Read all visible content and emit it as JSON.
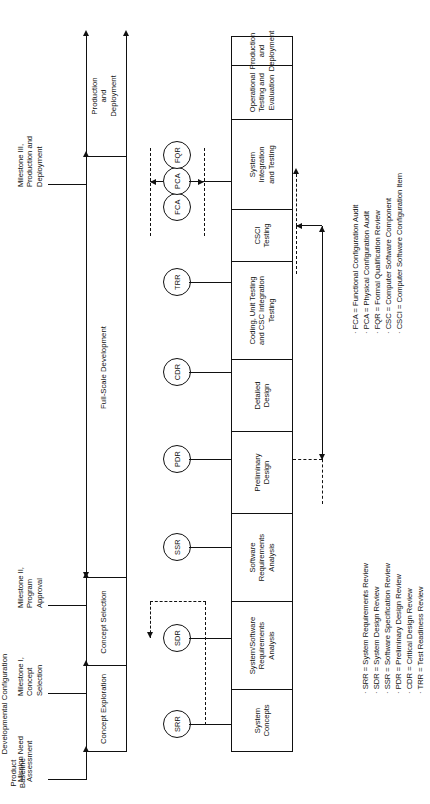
{
  "figure": {
    "orientation": "landscape-rotated-90",
    "phases": [
      {
        "id": "concept-exploration",
        "label": "Concept Exploration"
      },
      {
        "id": "concept-selection",
        "label": "Concept Selection"
      },
      {
        "id": "full-scale-development",
        "label": "Full-Scale Development"
      },
      {
        "id": "production-and-deployment",
        "label": "Production\nand\nDeployment"
      }
    ],
    "phase_band_labels": {
      "full_scale_development": "Full-Scale Development",
      "production_and_deployment_line1": "Production",
      "production_and_deployment_line2": "and",
      "production_and_deployment_line3": "Deployment"
    },
    "milestones": [
      {
        "id": "mission-need",
        "line1": "Mission Need",
        "line2": "Assessment",
        "line3": ""
      },
      {
        "id": "milestone-1",
        "line1": "Milestone I,",
        "line2": "Concept",
        "line3": "Selection"
      },
      {
        "id": "milestone-2",
        "line1": "Milestone II,",
        "line2": "Program",
        "line3": "Approval"
      },
      {
        "id": "milestone-3",
        "line1": "Milestone III,",
        "line2": "Production and",
        "line3": "Deployment"
      }
    ],
    "activities": [
      {
        "id": "system-concepts",
        "line1": "System",
        "line2": "Concepts",
        "line3": ""
      },
      {
        "id": "system-software-requirements-analysis",
        "line1": "System/Software",
        "line2": "Requirements",
        "line3": "Analysis"
      },
      {
        "id": "software-requirements-analysis",
        "line1": "Software",
        "line2": "Requirements",
        "line3": "Analysis"
      },
      {
        "id": "preliminary-design",
        "line1": "Preliminary",
        "line2": "Design",
        "line3": ""
      },
      {
        "id": "detailed-design",
        "line1": "Detailed",
        "line2": "Design",
        "line3": ""
      },
      {
        "id": "coding-unit-testing",
        "line1": "Coding, Unit Testing",
        "line2": "and CSC Integration",
        "line3": "Testing"
      },
      {
        "id": "csci-testing",
        "line1": "CSCI",
        "line2": "Testing",
        "line3": ""
      },
      {
        "id": "system-integration-and-testing",
        "line1": "System",
        "line2": "Integration",
        "line3": "and Testing"
      },
      {
        "id": "operational-testing-and-evaluation",
        "line1": "Operational",
        "line2": "Testing and",
        "line3": "Evaluation"
      },
      {
        "id": "production-and-deployment-box",
        "line1": "Production",
        "line2": "and",
        "line3": "Deployment"
      }
    ],
    "reviews": [
      {
        "id": "srr",
        "label": "SRR"
      },
      {
        "id": "sdr",
        "label": "SDR"
      },
      {
        "id": "ssr",
        "label": "SSR"
      },
      {
        "id": "pdr",
        "label": "PDR"
      },
      {
        "id": "cdr",
        "label": "CDR"
      },
      {
        "id": "trr",
        "label": "TRR"
      },
      {
        "id": "fca",
        "label": "FCA"
      },
      {
        "id": "pca",
        "label": "PCA"
      },
      {
        "id": "fqr",
        "label": "FQR"
      }
    ],
    "baselines": {
      "developmental_configuration": "Developmental Configuration",
      "product_baseline_line1": "Product",
      "product_baseline_line2": "Baseline"
    },
    "legend_reviews": [
      "· SRR = System Requirements Review",
      "· SDR = System Design Review",
      "· SSR = Software Specification Review",
      "· PDR = Preliminary Design Review",
      "· CDR = Critical Design Review",
      "· TRR = Test Readiness Review"
    ],
    "legend_audits": [
      "· FCA = Functional Configuration Audit",
      "· PCA = Physical Configuration Audit",
      "· FQR = Formal Qualification Review",
      "· CSC = Computer Software Component",
      "· CSCI = Computer Software Configuration Item"
    ],
    "colors": {
      "ink": "#111111",
      "paper": "#ffffff"
    }
  }
}
